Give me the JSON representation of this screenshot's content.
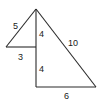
{
  "diagram": {
    "labels": {
      "small_hypotenuse": "5",
      "small_base": "3",
      "upper_vertical": "4",
      "lower_vertical": "4",
      "large_hypotenuse": "10",
      "large_base": "6"
    },
    "colors": {
      "stroke": "#2a2a2a",
      "text": "#1a1a1a",
      "background": "#ffffff"
    }
  }
}
